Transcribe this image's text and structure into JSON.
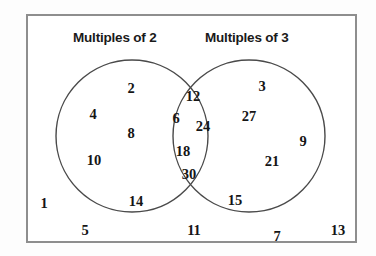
{
  "diagram": {
    "title_left": "Multiples of 2",
    "title_right": "Multiples of 3",
    "frame_color": "#8e8e8e",
    "circle_color": "#4a4a4a",
    "text_color": "#151515",
    "background_color": "#ffffff"
  },
  "chart_data": {
    "type": "venn",
    "title": "",
    "sets": [
      {
        "name": "Multiples of 2",
        "label_position": "top-left",
        "only_members": [
          2,
          4,
          8,
          10,
          14
        ]
      },
      {
        "name": "Multiples of 3",
        "label_position": "top-right",
        "only_members": [
          3,
          27,
          9,
          21,
          15
        ]
      }
    ],
    "intersection": {
      "name": "Multiples of 2 and 3",
      "members": [
        12,
        6,
        24,
        18,
        30
      ]
    },
    "outside": {
      "name": "Neither",
      "members": [
        1,
        5,
        11,
        7,
        13
      ]
    },
    "universe": [
      1,
      2,
      3,
      4,
      5,
      6,
      7,
      8,
      9,
      10,
      11,
      12,
      13,
      14,
      15,
      18,
      21,
      24,
      27,
      30
    ],
    "grid": false,
    "legend": "none"
  },
  "numbers": {
    "left_only": [
      {
        "value": "2",
        "x": 131,
        "y": 88
      },
      {
        "value": "4",
        "x": 93,
        "y": 114
      },
      {
        "value": "8",
        "x": 131,
        "y": 133
      },
      {
        "value": "10",
        "x": 94,
        "y": 160
      },
      {
        "value": "14",
        "x": 136,
        "y": 201
      }
    ],
    "intersection": [
      {
        "value": "12",
        "x": 193,
        "y": 96
      },
      {
        "value": "6",
        "x": 176,
        "y": 118
      },
      {
        "value": "24",
        "x": 203,
        "y": 126
      },
      {
        "value": "18",
        "x": 183,
        "y": 151
      },
      {
        "value": "30",
        "x": 189,
        "y": 174
      }
    ],
    "right_only": [
      {
        "value": "3",
        "x": 262,
        "y": 86
      },
      {
        "value": "27",
        "x": 249,
        "y": 116
      },
      {
        "value": "9",
        "x": 303,
        "y": 141
      },
      {
        "value": "21",
        "x": 272,
        "y": 161
      },
      {
        "value": "15",
        "x": 235,
        "y": 200
      }
    ],
    "outside": [
      {
        "value": "1",
        "x": 44,
        "y": 203
      },
      {
        "value": "5",
        "x": 85,
        "y": 230
      },
      {
        "value": "11",
        "x": 194,
        "y": 230
      },
      {
        "value": "7",
        "x": 277,
        "y": 236
      },
      {
        "value": "13",
        "x": 338,
        "y": 230
      }
    ]
  },
  "geometry": {
    "left_circle": {
      "cx": 132,
      "cy": 136,
      "r": 76
    },
    "right_circle": {
      "cx": 249,
      "cy": 136,
      "r": 76
    },
    "frame": {
      "x": 26,
      "y": 14,
      "w": 331,
      "h": 229
    }
  }
}
